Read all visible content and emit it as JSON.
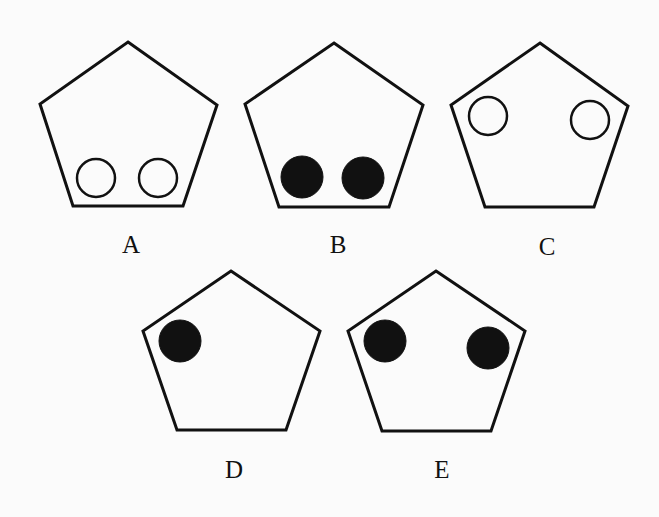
{
  "diagram": {
    "stroke_color": "#111111",
    "fill_color": "#111111",
    "background": "#fbfbfb",
    "figures": [
      {
        "label": "A",
        "pentagon": [
          [
            128,
            42
          ],
          [
            217,
            105
          ],
          [
            183,
            206
          ],
          [
            73,
            206
          ],
          [
            40,
            104
          ]
        ],
        "label_pos": [
          131,
          253
        ],
        "circles": [
          {
            "cx": 96,
            "cy": 178,
            "r": 20,
            "filled": false
          },
          {
            "cx": 158,
            "cy": 178,
            "r": 20,
            "filled": false
          }
        ]
      },
      {
        "label": "B",
        "pentagon": [
          [
            334,
            43
          ],
          [
            423,
            105
          ],
          [
            389,
            207
          ],
          [
            279,
            207
          ],
          [
            245,
            104
          ]
        ],
        "label_pos": [
          338,
          253
        ],
        "circles": [
          {
            "cx": 302,
            "cy": 177,
            "r": 21,
            "filled": true
          },
          {
            "cx": 363,
            "cy": 178,
            "r": 21,
            "filled": true
          }
        ]
      },
      {
        "label": "C",
        "pentagon": [
          [
            540,
            43
          ],
          [
            628,
            106
          ],
          [
            594,
            207
          ],
          [
            485,
            207
          ],
          [
            451,
            105
          ]
        ],
        "label_pos": [
          547,
          255
        ],
        "circles": [
          {
            "cx": 488,
            "cy": 116,
            "r": 20,
            "filled": false
          },
          {
            "cx": 590,
            "cy": 120,
            "r": 20,
            "filled": false
          }
        ]
      },
      {
        "label": "D",
        "pentagon": [
          [
            231,
            271
          ],
          [
            320,
            331
          ],
          [
            286,
            430
          ],
          [
            177,
            430
          ],
          [
            143,
            331
          ]
        ],
        "label_pos": [
          234,
          478
        ],
        "circles": [
          {
            "cx": 180,
            "cy": 341,
            "r": 21,
            "filled": true
          }
        ]
      },
      {
        "label": "E",
        "pentagon": [
          [
            436,
            271
          ],
          [
            525,
            331
          ],
          [
            491,
            431
          ],
          [
            382,
            431
          ],
          [
            348,
            331
          ]
        ],
        "label_pos": [
          442,
          478
        ],
        "circles": [
          {
            "cx": 385,
            "cy": 341,
            "r": 21,
            "filled": true
          },
          {
            "cx": 488,
            "cy": 348,
            "r": 21,
            "filled": true
          }
        ]
      }
    ]
  }
}
